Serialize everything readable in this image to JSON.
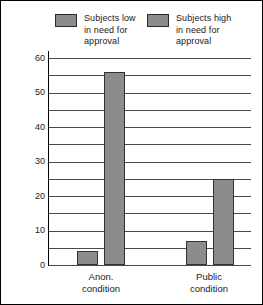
{
  "chart_data": {
    "type": "bar",
    "title": "",
    "xlabel": "",
    "ylabel": "",
    "categories": [
      "Anon.\ncondition",
      "Public\ncondition"
    ],
    "series": [
      {
        "name": "Subjects low\nin need for\napproval",
        "values": [
          4,
          7
        ],
        "color": "#8c8c8c"
      },
      {
        "name": "Subjects high\nin need for\napproval",
        "values": [
          56,
          25
        ],
        "color": "#8c8c8c"
      }
    ],
    "ylim": [
      0,
      60
    ],
    "ytick_labels": [
      "0",
      "10",
      "20",
      "30",
      "40",
      "50",
      "60"
    ],
    "ytick_values": [
      0,
      10,
      20,
      30,
      40,
      50,
      60
    ],
    "gridline_values": [
      0,
      5,
      10,
      15,
      20,
      25,
      30,
      35,
      40,
      45,
      50,
      55,
      60
    ],
    "grid": true,
    "legend_position": "top"
  },
  "legend": {
    "entries": [
      {
        "label": "Subjects low\nin need for\napproval",
        "color": "#8c8c8c"
      },
      {
        "label": "Subjects high\nin need for\napproval",
        "color": "#8c8c8c"
      }
    ]
  },
  "axes": {
    "y_labels": [
      "60",
      "50",
      "40",
      "30",
      "20",
      "10",
      "0"
    ],
    "x_labels": [
      "Anon.\ncondition",
      "Public\ncondition"
    ]
  },
  "colors": {
    "bar_fill": "#8c8c8c",
    "bar_stroke": "#333333",
    "gridline": "#4a4a4a",
    "axis": "#000000",
    "text": "#1a1a1a",
    "background": "#ffffff"
  }
}
